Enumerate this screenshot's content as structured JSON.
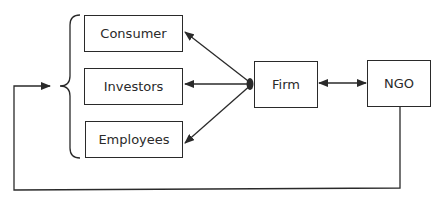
{
  "diagram": {
    "stakeholders": [
      {
        "id": "consumer",
        "label": "Consumer"
      },
      {
        "id": "investors",
        "label": "Investors"
      },
      {
        "id": "employees",
        "label": "Employees"
      }
    ],
    "firm": {
      "label": "Firm"
    },
    "ngo": {
      "label": "NGO"
    },
    "edges": [
      {
        "from": "firm",
        "to": "consumer",
        "type": "arrow"
      },
      {
        "from": "firm",
        "to": "investors",
        "type": "arrow"
      },
      {
        "from": "firm",
        "to": "employees",
        "type": "arrow"
      },
      {
        "from": "firm",
        "to": "ngo",
        "type": "bidirectional"
      },
      {
        "from": "ngo",
        "to": "stakeholders-group",
        "type": "feedback-arrow"
      }
    ],
    "colors": {
      "line": "#2a2a2a",
      "background": "#ffffff"
    }
  }
}
